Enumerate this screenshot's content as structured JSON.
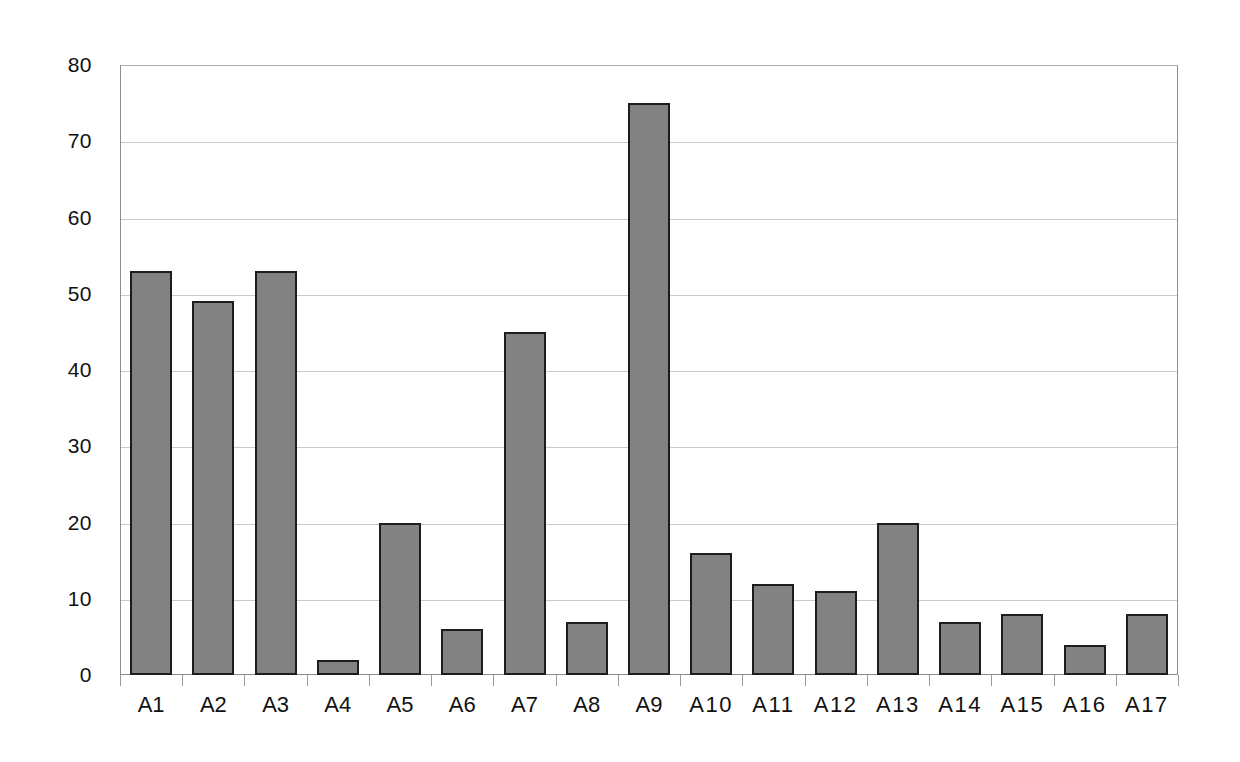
{
  "chart_data": {
    "type": "bar",
    "title": "",
    "subtitle": "",
    "xlabel": "",
    "ylabel": "",
    "categories": [
      "A1",
      "A2",
      "A3",
      "A4",
      "A5",
      "A6",
      "A7",
      "A8",
      "A9",
      "A10",
      "A11",
      "A12",
      "A13",
      "A14",
      "A15",
      "A16",
      "A17"
    ],
    "values": [
      53,
      49,
      53,
      2,
      20,
      6,
      45,
      7,
      75,
      16,
      12,
      11,
      20,
      7,
      8,
      4,
      8
    ],
    "series": [
      {
        "name": "",
        "values": [
          53,
          49,
          53,
          2,
          20,
          6,
          45,
          7,
          75,
          16,
          12,
          11,
          20,
          7,
          8,
          4,
          8
        ]
      }
    ],
    "ylim": [
      0,
      80
    ],
    "yticks": [
      0,
      10,
      20,
      30,
      40,
      50,
      60,
      70,
      80
    ],
    "ytick_labels": [
      "0",
      "10",
      "20",
      "30",
      "40",
      "50",
      "60",
      "70",
      "80"
    ],
    "grid": true,
    "grid_axis": "y",
    "legend": false,
    "legend_position": "none",
    "annotations": [],
    "bar_fill_color": "#828282",
    "bar_edge_color": "#1d1d1d",
    "gridline_color": "#c9c9c9",
    "axis_color": "#8c8c8c",
    "background_color": "#ffffff"
  }
}
